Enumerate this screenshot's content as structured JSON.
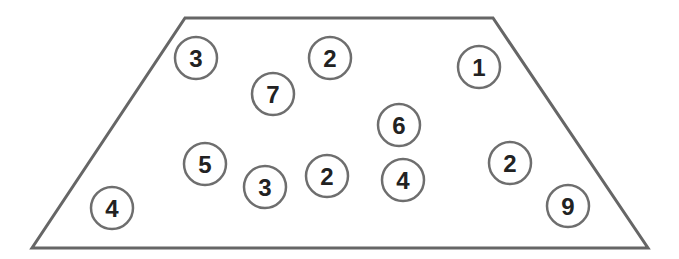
{
  "diagram": {
    "shape": "trapezoid",
    "stroke_color": "#666666",
    "circle_stroke_color": "#6e6e6e",
    "text_color": "#222222",
    "trapezoid_points": [
      [
        185,
        18
      ],
      [
        493,
        18
      ],
      [
        648,
        248
      ],
      [
        32,
        248
      ]
    ],
    "circles": [
      {
        "value": "3",
        "cx": 196,
        "cy": 58
      },
      {
        "value": "2",
        "cx": 330,
        "cy": 58
      },
      {
        "value": "1",
        "cx": 479,
        "cy": 67
      },
      {
        "value": "7",
        "cx": 273,
        "cy": 94
      },
      {
        "value": "6",
        "cx": 399,
        "cy": 125
      },
      {
        "value": "5",
        "cx": 205,
        "cy": 164
      },
      {
        "value": "3",
        "cx": 265,
        "cy": 187
      },
      {
        "value": "2",
        "cx": 327,
        "cy": 176
      },
      {
        "value": "4",
        "cx": 403,
        "cy": 180
      },
      {
        "value": "2",
        "cx": 510,
        "cy": 163
      },
      {
        "value": "4",
        "cx": 112,
        "cy": 208
      },
      {
        "value": "9",
        "cx": 568,
        "cy": 206
      }
    ]
  }
}
